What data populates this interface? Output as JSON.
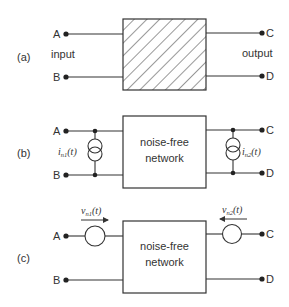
{
  "figure": {
    "panels": [
      {
        "id": "a",
        "tag": "(a)",
        "box": {
          "fill": "hatched",
          "label": ""
        },
        "left_label": "input",
        "right_label": "output",
        "terminals": {
          "top_left": "A",
          "bottom_left": "B",
          "top_right": "C",
          "bottom_right": "D"
        }
      },
      {
        "id": "b",
        "tag": "(b)",
        "box": {
          "label_line1": "noise-free",
          "label_line2": "network"
        },
        "terminals": {
          "top_left": "A",
          "bottom_left": "B",
          "top_right": "C",
          "bottom_right": "D"
        },
        "sources": [
          {
            "type": "current",
            "symbol": "i",
            "subscript": "n1",
            "arg": "(t)",
            "side": "input"
          },
          {
            "type": "current",
            "symbol": "i",
            "subscript": "n2",
            "arg": "(t)",
            "side": "output"
          }
        ]
      },
      {
        "id": "c",
        "tag": "(c)",
        "box": {
          "label_line1": "noise-free",
          "label_line2": "network"
        },
        "terminals": {
          "top_left": "A",
          "bottom_left": "B",
          "top_right": "C",
          "bottom_right": "D"
        },
        "sources": [
          {
            "type": "voltage",
            "symbol": "v",
            "subscript": "n1",
            "arg": "(t)",
            "side": "input",
            "arrow": "right"
          },
          {
            "type": "voltage",
            "symbol": "v",
            "subscript": "n2",
            "arg": "(t)",
            "side": "output",
            "arrow": "left"
          }
        ]
      }
    ]
  }
}
